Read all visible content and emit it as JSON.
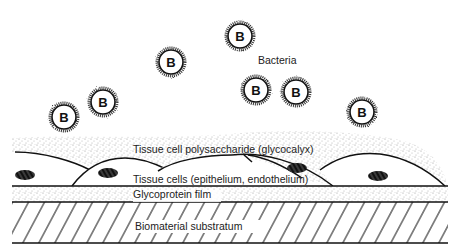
{
  "diagram": {
    "labels": {
      "bacteria": "Bacteria",
      "glycocalyx": "Tissue cell polysaccharide (glycocalyx)",
      "tissue_cells": "Tissue cells (epithelium, endothelium)",
      "glycoprotein": "Glycoprotein film",
      "substratum": "Biomaterial substratum"
    },
    "bacteria": [
      {
        "letter": "B",
        "cx": 64,
        "cy": 117
      },
      {
        "letter": "B",
        "cx": 103,
        "cy": 102
      },
      {
        "letter": "B",
        "cx": 171,
        "cy": 62
      },
      {
        "letter": "B",
        "cx": 240,
        "cy": 36
      },
      {
        "letter": "B",
        "cx": 256,
        "cy": 90
      },
      {
        "letter": "B",
        "cx": 296,
        "cy": 92
      },
      {
        "letter": "B",
        "cx": 362,
        "cy": 112
      }
    ],
    "colors": {
      "line": "#111111",
      "stipple": "#9a9a9a",
      "background": "#ffffff"
    }
  }
}
